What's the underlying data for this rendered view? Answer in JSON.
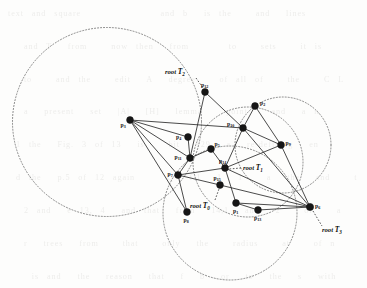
{
  "figure": {
    "background_text": "text and square          and b  is the   and  lines\n\n  and T  from   now then  from     to   sets   it is\n\n  to   and the   edit  A  degree   of all of   the   C L\n\n  a  present  set  |A|  [H]  lemma   point   and  a n\n\n 1 the  Fig. 3 of 13  is   bit  129  a  re-defining  en\n\n d the  p.5 of 12 again    Q  f.1  1  1   a  the  and   t\n\n  2 and  e 13, 4  and that  from  14,1  and  2   of   a\n\n  r  trees  from   that   only  the   radius   at   of n\n\n   is and  the  reason  that  f  b  or  to  the  s  with\n\n\n\n   bus  32  the   closed    points   and   we   of t\n\n  of the  all  the  c  of  the  root   of  T     of a\n\n  n  of  the  line   and   the   set   a  the   n  to t\n\n  0  a  points   of  the   and   1 13 b  a  a  of\n\n  C  1  and  a  a   and  n  n  a  13 b  a  tangent\n\n we  fixed  p  of  that   of  the  and  the   of   t\n\n  to  s  and   f  that   the   sets  of  a   of   to"
  },
  "colors": {
    "node": "#161616",
    "edge": "#2b2b2b",
    "circle": "#6b6b6b",
    "background": "#fdfdfc"
  },
  "chart_data": {
    "type": "scatter",
    "xlabel": "",
    "ylabel": "",
    "xlim": [
      0,
      367
    ],
    "ylim": [
      0,
      288
    ],
    "grid": false,
    "legend": "none",
    "nodes": [
      {
        "id": "p3",
        "label": "p",
        "sub": "3",
        "x": 130,
        "y": 120,
        "r": 3.4,
        "label_dx": -9.5,
        "label_dy": 6.5
      },
      {
        "id": "p12",
        "label": "p",
        "sub": "12",
        "x": 205,
        "y": 92,
        "r": 3.4,
        "label_dx": -4.0,
        "label_dy": -5.0
      },
      {
        "id": "p2",
        "label": "p",
        "sub": "2",
        "x": 255,
        "y": 106,
        "r": 3.4,
        "label_dx": 5.0,
        "label_dy": -1.0
      },
      {
        "id": "p10",
        "label": "p",
        "sub": "10",
        "x": 243,
        "y": 128,
        "r": 3.4,
        "label_dx": -16.0,
        "label_dy": -2.0
      },
      {
        "id": "p4",
        "label": "p",
        "sub": "4",
        "x": 188,
        "y": 137,
        "r": 3.4,
        "label_dx": -12.0,
        "label_dy": 1.5
      },
      {
        "id": "p9",
        "label": "p",
        "sub": "9",
        "x": 281,
        "y": 145,
        "r": 3.4,
        "label_dx": 4.5,
        "label_dy": -0.5
      },
      {
        "id": "p5",
        "label": "p",
        "sub": "5",
        "x": 211,
        "y": 149,
        "r": 3.4,
        "label_dx": 3.5,
        "label_dy": -3.5
      },
      {
        "id": "p11",
        "label": "p",
        "sub": "11",
        "x": 190,
        "y": 158,
        "r": 3.4,
        "label_dx": -15.5,
        "label_dy": 0.5
      },
      {
        "id": "p14",
        "label": "p",
        "sub": "14",
        "x": 225,
        "y": 168,
        "r": 3.4,
        "label_dx": -6.0,
        "label_dy": -5.0
      },
      {
        "id": "p7",
        "label": "p",
        "sub": "7",
        "x": 178,
        "y": 175,
        "r": 3.4,
        "label_dx": -10.5,
        "label_dy": 0.5
      },
      {
        "id": "p15",
        "label": "p",
        "sub": "15",
        "x": 220,
        "y": 185,
        "r": 3.4,
        "label_dx": -6.5,
        "label_dy": -5.5
      },
      {
        "id": "p1",
        "label": "p",
        "sub": "1",
        "x": 236,
        "y": 203,
        "r": 3.4,
        "label_dx": -3.0,
        "label_dy": 9.5
      },
      {
        "id": "p8",
        "label": "p",
        "sub": "8",
        "x": 187,
        "y": 212,
        "r": 3.4,
        "label_dx": -3.5,
        "label_dy": 9.5
      },
      {
        "id": "p13",
        "label": "p",
        "sub": "13",
        "x": 258,
        "y": 210,
        "r": 3.4,
        "label_dx": -4.0,
        "label_dy": 10.0
      },
      {
        "id": "p6",
        "label": "p",
        "sub": "6",
        "x": 310,
        "y": 207,
        "r": 3.6,
        "label_dx": 5.0,
        "label_dy": 1.0
      }
    ],
    "edges": [
      [
        "p3",
        "p4"
      ],
      [
        "p3",
        "p11"
      ],
      [
        "p3",
        "p7"
      ],
      [
        "p3",
        "p10"
      ],
      [
        "p3",
        "p8"
      ],
      [
        "p12",
        "p11"
      ],
      [
        "p12",
        "p10"
      ],
      [
        "p2",
        "p10"
      ],
      [
        "p2",
        "p9"
      ],
      [
        "p10",
        "p9"
      ],
      [
        "p10",
        "p6"
      ],
      [
        "p10",
        "p14"
      ],
      [
        "p4",
        "p11"
      ],
      [
        "p9",
        "p6"
      ],
      [
        "p9",
        "p14"
      ],
      [
        "p5",
        "p11"
      ],
      [
        "p5",
        "p14"
      ],
      [
        "p11",
        "p7"
      ],
      [
        "p14",
        "p7"
      ],
      [
        "p14",
        "p6"
      ],
      [
        "p14",
        "p1"
      ],
      [
        "p7",
        "p8"
      ],
      [
        "p7",
        "p15"
      ],
      [
        "p15",
        "p6"
      ],
      [
        "p1",
        "p6"
      ],
      [
        "p1",
        "p13"
      ],
      [
        "p13",
        "p6"
      ]
    ],
    "circles": [
      {
        "id": "circle-T2",
        "cx": 107,
        "cy": 122,
        "r": 94.5
      },
      {
        "id": "circle-T1",
        "cx": 283,
        "cy": 145,
        "r": 48.0
      },
      {
        "id": "circle-T0",
        "cx": 230,
        "cy": 213,
        "r": 67.0
      },
      {
        "id": "circle-mid",
        "cx": 248,
        "cy": 162,
        "r": 55.0
      }
    ],
    "root_annotations": [
      {
        "id": "root-T2",
        "label": "root",
        "tree": "T",
        "sub": "2",
        "text_x": 165,
        "text_y": 74,
        "leader": [
          [
            196,
            78
          ],
          [
            203,
            88
          ]
        ],
        "target": "p12"
      },
      {
        "id": "root-T1",
        "label": "root",
        "tree": "T",
        "sub": "1",
        "text_x": 243,
        "text_y": 170,
        "leader": [
          [
            241,
            168
          ],
          [
            229,
            169
          ]
        ],
        "target": "p14"
      },
      {
        "id": "root-T0",
        "label": "root",
        "tree": "T",
        "sub": "0",
        "text_x": 190,
        "text_y": 208,
        "leader": [
          [
            215,
            200
          ],
          [
            219,
            189
          ]
        ],
        "target": "p15"
      },
      {
        "id": "root-T3",
        "label": "root",
        "tree": "T",
        "sub": "3",
        "text_x": 322,
        "text_y": 232,
        "leader": [
          [
            313,
            211
          ],
          [
            322,
            226
          ]
        ],
        "target": "p6"
      }
    ]
  }
}
